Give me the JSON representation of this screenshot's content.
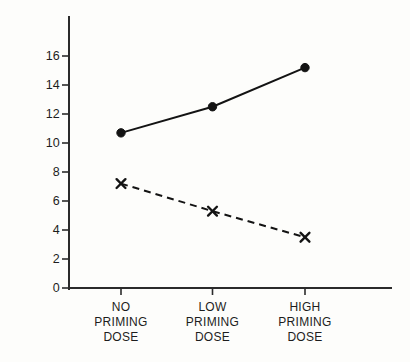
{
  "chart_data": {
    "type": "line",
    "title": "",
    "subtitle": "",
    "xlabel": "",
    "ylabel": "MINUTES",
    "categories": [
      "NO PRIMING DOSE",
      "LOW PRIMING DOSE",
      "HIGH PRIMING DOSE"
    ],
    "category_lines": [
      [
        "NO",
        "PRIMING",
        "DOSE"
      ],
      [
        "LOW",
        "PRIMING",
        "DOSE"
      ],
      [
        "HIGH",
        "PRIMING",
        "DOSE"
      ]
    ],
    "series": [
      {
        "name": "solid-line",
        "marker": "filled-circle",
        "line_style": "solid",
        "color": "#131313",
        "values": [
          10.7,
          12.5,
          15.2
        ]
      },
      {
        "name": "dashed-line",
        "marker": "cross-x",
        "line_style": "dashed",
        "color": "#131313",
        "values": [
          7.2,
          5.3,
          3.5
        ]
      }
    ],
    "ylim": [
      0,
      17
    ],
    "yticks": [
      0,
      2,
      4,
      6,
      8,
      10,
      12,
      14,
      16
    ],
    "ytick_labels": [
      "0",
      "2",
      "4",
      "6",
      "8",
      "10",
      "12",
      "14",
      "16"
    ],
    "grid": false,
    "legend": "none"
  },
  "axes": {
    "y_axis_name": "minutes-axis",
    "x_axis_name": "priming-dose-axis"
  }
}
